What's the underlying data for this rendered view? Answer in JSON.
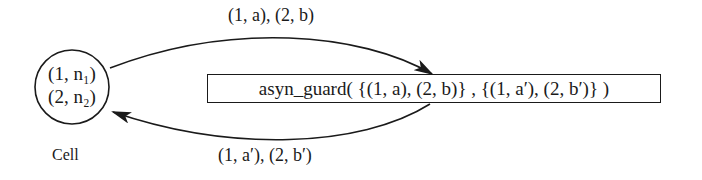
{
  "diagram": {
    "node": {
      "line1": "(1, n₁)",
      "line2": "(2, n₂)",
      "caption": "Cell"
    },
    "guard": {
      "label": "asyn_guard( {(1, a), (2, b)} ,  {(1, a′), (2, b′)} )"
    },
    "edges": {
      "top_label": "(1, a), (2, b)",
      "bottom_label": "(1, a′), (2, b′)"
    },
    "colors": {
      "stroke": "#1a1a1a",
      "background": "#ffffff"
    }
  }
}
